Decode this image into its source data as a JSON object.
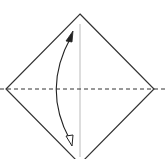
{
  "diagram": {
    "type": "origami-fold-step",
    "colors": {
      "background": "#ffffff",
      "outline": "#333333",
      "crease": "#bbbbbb",
      "fold_line": "#333333",
      "arrow": "#222222"
    },
    "shapes": {
      "diamond": {
        "top": [
          80,
          14
        ],
        "right": [
          154,
          89
        ],
        "bottom": [
          80,
          164
        ],
        "left": [
          6,
          89
        ]
      },
      "crease_line": {
        "x": 80,
        "y1": 24,
        "y2": 157
      },
      "valley_fold_line": {
        "y": 89,
        "x1": 0,
        "x2": 166,
        "dash": "4,3"
      },
      "fold_arrow": {
        "start": [
          71,
          33
        ],
        "control": [
          42,
          89
        ],
        "end": [
          71,
          146
        ],
        "start_head": "filled",
        "end_head": "hollow"
      }
    }
  }
}
